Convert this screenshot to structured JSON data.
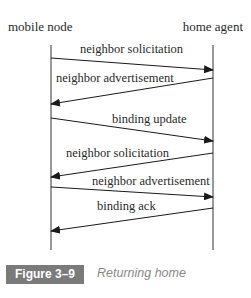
{
  "diagram": {
    "type": "sequence",
    "participants": [
      {
        "id": "mn",
        "label": "mobile node"
      },
      {
        "id": "ha",
        "label": "home agent"
      }
    ],
    "messages": [
      {
        "from": "mobile node",
        "to": "home agent",
        "label": "neighbor solicitation"
      },
      {
        "from": "home agent",
        "to": "mobile node",
        "label": "neighbor advertisement"
      },
      {
        "from": "mobile node",
        "to": "home agent",
        "label": "binding update"
      },
      {
        "from": "home agent",
        "to": "mobile node",
        "label": "neighbor solicitation"
      },
      {
        "from": "mobile node",
        "to": "home agent",
        "label": "neighbor advertisement"
      },
      {
        "from": "home agent",
        "to": "mobile node",
        "label": "binding ack"
      }
    ]
  },
  "figure": {
    "number": "Figure 3–9",
    "caption": "Returning home",
    "badge_color": "#7a7a7a"
  }
}
